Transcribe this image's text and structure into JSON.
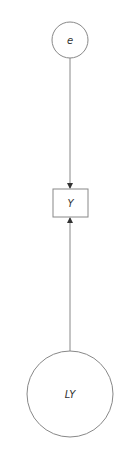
{
  "diagram": {
    "nodes": [
      {
        "id": "e",
        "label": "e",
        "shape": "circle",
        "cx": 70,
        "cy": 40,
        "r": 18
      },
      {
        "id": "Y",
        "label": "Y",
        "shape": "rect",
        "x": 53,
        "y": 189,
        "width": 35,
        "height": 28
      },
      {
        "id": "LY",
        "label": "LY",
        "shape": "circle",
        "cx": 70,
        "cy": 394,
        "r": 43
      }
    ],
    "edges": [
      {
        "from": "e",
        "to": "Y"
      },
      {
        "from": "LY",
        "to": "Y"
      }
    ],
    "colors": {
      "stroke": "#888888",
      "arrow": "#333333",
      "text": "#333333",
      "background": "#ffffff"
    }
  }
}
